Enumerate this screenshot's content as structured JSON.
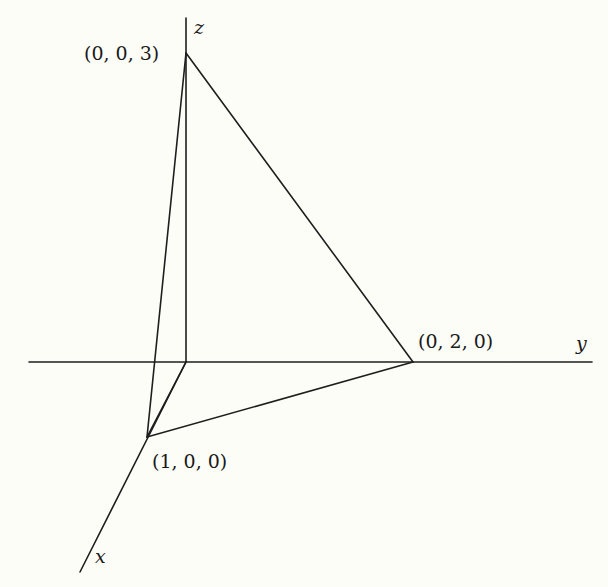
{
  "diagram": {
    "type": "3d-coordinate-tetrahedron",
    "axes": {
      "x": {
        "label": "x",
        "from": [
          186,
          362
        ],
        "to": [
          80,
          572
        ],
        "label_pos": [
          95,
          563
        ]
      },
      "y": {
        "label": "y",
        "from": [
          29,
          362
        ],
        "to": [
          592,
          362
        ],
        "label_pos": [
          576,
          350
        ]
      },
      "z": {
        "label": "z",
        "from": [
          186,
          362
        ],
        "to": [
          186,
          18
        ],
        "label_pos": [
          194,
          34
        ]
      }
    },
    "points": [
      {
        "id": "origin",
        "label": "",
        "pos": [
          186,
          362
        ]
      },
      {
        "id": "p-x",
        "label": "(1, 0, 0)",
        "pos": [
          147,
          437
        ],
        "label_pos": [
          152,
          468
        ]
      },
      {
        "id": "p-y",
        "label": "(0, 2, 0)",
        "pos": [
          413,
          362
        ],
        "label_pos": [
          418,
          348
        ]
      },
      {
        "id": "p-z",
        "label": "(0, 0, 3)",
        "pos": [
          186,
          53
        ],
        "label_pos": [
          84,
          60
        ]
      }
    ],
    "edges": [
      {
        "from": "p-z",
        "to": "p-x"
      },
      {
        "from": "p-z",
        "to": "p-y"
      },
      {
        "from": "p-x",
        "to": "p-y"
      },
      {
        "from": "origin",
        "to": "p-x"
      }
    ]
  }
}
